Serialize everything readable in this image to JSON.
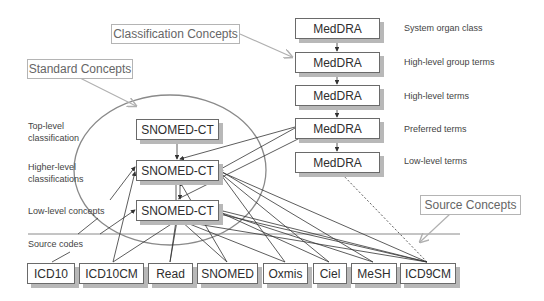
{
  "callouts": {
    "classification": "Classification Concepts",
    "standard": "Standard Concepts",
    "source": "Source Concepts"
  },
  "meddra": {
    "boxes": [
      "MedDRA",
      "MedDRA",
      "MedDRA",
      "MedDRA",
      "MedDRA"
    ],
    "levels": [
      "System organ class",
      "High-level group terms",
      "High-level terms",
      "Preferred terms",
      "Low-level terms"
    ]
  },
  "snomed": {
    "boxes": [
      "SNOMED-CT",
      "SNOMED-CT",
      "SNOMED-CT"
    ]
  },
  "left_labels": {
    "top_level_1": "Top-level",
    "top_level_2": "classification",
    "higher_level_1": "Higher-level",
    "higher_level_2": "classifications",
    "low_level": "Low-level concepts",
    "source_codes": "Source codes"
  },
  "sources": [
    "ICD10",
    "ICD10CM",
    "Read",
    "SNOMED",
    "Oxmis",
    "Ciel",
    "MeSH",
    "ICD9CM"
  ],
  "colors": {
    "box_border": "#6a6a6a",
    "box_shadow": "#b8b8b8",
    "callout_border": "#b4b4b4",
    "callout_arrow": "#b0b0b0",
    "ellipse": "#8a8a8a",
    "line": "#3c3c3c"
  }
}
